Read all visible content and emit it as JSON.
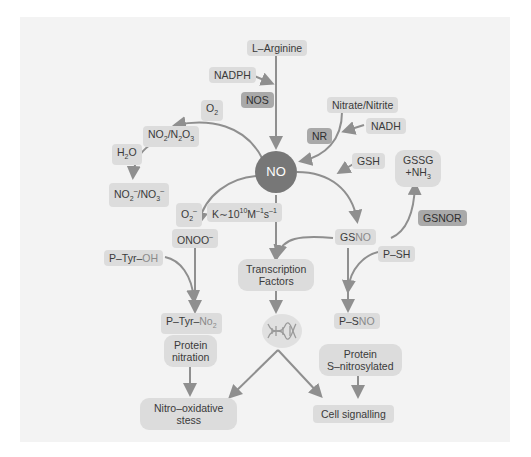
{
  "diagram": {
    "center": {
      "label": "NO",
      "color": "#777777"
    },
    "nodes": {
      "l_arginine": "L–Arginine",
      "nadph": "NADPH",
      "nos": "NOS",
      "nitrate_nitrite": "Nitrate/Nitrite",
      "nadh": "NADH",
      "nr": "NR",
      "o2": "O",
      "o2_sub": "2",
      "no2_n2o3_a": "NO",
      "no2_n2o3_sub1": "2",
      "no2_n2o3_b": "/N",
      "no2_n2o3_sub2": "2",
      "no2_n2o3_c": "O",
      "no2_n2o3_sub3": "3",
      "h2o_a": "H",
      "h2o_sub": "2",
      "h2o_b": "O",
      "nox_a": "NO",
      "nox_sub1": "2",
      "nox_sup1": "–",
      "nox_b": "/NO",
      "nox_sub2": "3",
      "nox_sup2": "–",
      "superoxide": "O",
      "superoxide_sub": "2",
      "superoxide_sup": "–",
      "rate_a": "K∼10",
      "rate_sup1": "10",
      "rate_b": "M",
      "rate_sup2": "–1",
      "rate_c": "s",
      "rate_sup3": "–1",
      "peroxynitrite": "ONOO",
      "peroxynitrite_sup": "–",
      "gsh": "GSH",
      "gssg_line1": "GSSG",
      "gssg_line2": "+NH",
      "gssg_sub": "3",
      "gsnor": "GSNOR",
      "gsno_a": "GS",
      "gsno_b": "NO",
      "p_tyr_oh_a": "P–Tyr–",
      "p_tyr_oh_b": "OH",
      "transcription_factors_1": "Transcription",
      "transcription_factors_2": "Factors",
      "p_sh": "P–SH",
      "p_tyr_no2_a": "P–Tyr–",
      "p_tyr_no2_b": "No",
      "p_tyr_no2_sub": "2",
      "p_sno_a": "P–S",
      "p_sno_b": "NO",
      "protein_nitration_1": "Protein",
      "protein_nitration_2": "nitration",
      "protein_snitrosylated_1": "Protein",
      "protein_snitrosylated_2": "S–nitrosylated",
      "nitro_oxidative_1": "Nitro–oxidative",
      "nitro_oxidative_2": "stess",
      "cell_signalling": "Cell signalling"
    },
    "icons": {
      "dna": "dna-helix-icon"
    },
    "colors": {
      "panel": "#f3f3f3",
      "node_light": "#dcdcdc",
      "node_dark": "#a9a9a9",
      "arrow": "#8f8f8f",
      "center": "#777777"
    }
  }
}
